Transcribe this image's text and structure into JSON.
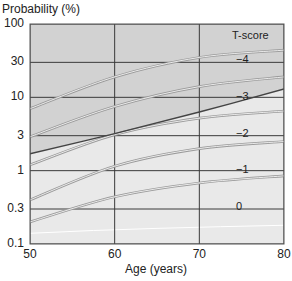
{
  "chart_data": {
    "type": "line",
    "title": "",
    "xlabel": "Age (years)",
    "ylabel": "Probability (%)",
    "x_scale": "linear",
    "y_scale": "log",
    "xlim": [
      50,
      80
    ],
    "ylim": [
      0.1,
      100
    ],
    "x_ticks": [
      "50",
      "60",
      "70",
      "80"
    ],
    "y_ticks": [
      "100",
      "30",
      "10",
      "3",
      "1",
      "0.3",
      "0.1"
    ],
    "grid": true,
    "legend_title": "T-score",
    "legend_position": "inside-right",
    "x": [
      50,
      60,
      70,
      80
    ],
    "series": [
      {
        "name": "-4",
        "label": "−4",
        "values": [
          7,
          19,
          35,
          44
        ]
      },
      {
        "name": "-3",
        "label": "−3",
        "values": [
          2.9,
          7.5,
          14,
          19
        ]
      },
      {
        "name": "-2",
        "label": "−2",
        "values": [
          1.2,
          3.1,
          5.2,
          6.5
        ]
      },
      {
        "name": "-1",
        "label": "−1",
        "values": [
          0.4,
          1.15,
          2.0,
          2.5
        ]
      },
      {
        "name": "0",
        "label": "0",
        "values": [
          0.2,
          0.44,
          0.68,
          0.85
        ]
      }
    ],
    "threshold_line": {
      "name": "intervention threshold",
      "values": [
        1.7,
        3.2,
        6.3,
        13
      ]
    },
    "shading": "darker grey above threshold line, lighter grey below"
  },
  "labels": {
    "ylabel": "Probability (%)",
    "xlabel": "Age (years)",
    "legend_title": "T-score"
  },
  "colors": {
    "upper_region": "#d2d2d2",
    "lower_region": "#e9e9e9",
    "grid": "#3a3a3a",
    "curve_outline": "#9a9a9a",
    "curve_fill": "#f4f4f4",
    "threshold": "#444444"
  }
}
